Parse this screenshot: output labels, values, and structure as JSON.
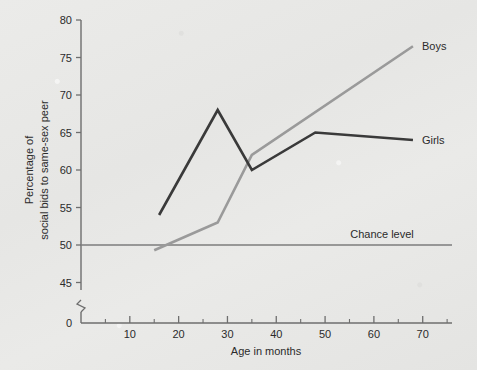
{
  "chart_data": {
    "type": "line",
    "title": "",
    "xlabel": "Age in months",
    "ylabel_line1": "Percentage of",
    "ylabel_line2": "social bids to same-sex peer",
    "xlim": [
      0,
      76
    ],
    "ylim": [
      44,
      80
    ],
    "y_axis_break": true,
    "y_zero_label": "0",
    "xticks": [
      10,
      20,
      30,
      40,
      50,
      60,
      70
    ],
    "xtick_labels": [
      "10",
      "20",
      "30",
      "40",
      "50",
      "60",
      "70"
    ],
    "xminor_ticks": [
      5,
      15,
      25,
      35,
      45,
      55,
      65,
      75
    ],
    "yticks": [
      45,
      50,
      55,
      60,
      65,
      70,
      75,
      80
    ],
    "ytick_labels": [
      "45",
      "50",
      "55",
      "60",
      "65",
      "70",
      "75",
      "80"
    ],
    "grid": false,
    "legend_position": "inline-end-of-line",
    "annotations": [
      {
        "text": "Chance level",
        "value": 50,
        "kind": "reference-line"
      }
    ],
    "series": [
      {
        "name": "Boys",
        "label": "Boys",
        "color": "#9a9a9a",
        "x": [
          15,
          28,
          35,
          68
        ],
        "y": [
          49.3,
          53.0,
          62.0,
          76.5
        ]
      },
      {
        "name": "Girls",
        "label": "Girls",
        "color": "#3a3a3a",
        "x": [
          16,
          28,
          35,
          48,
          68
        ],
        "y": [
          54.0,
          68.0,
          60.0,
          65.0,
          64.0
        ]
      }
    ]
  },
  "figure": {
    "axis_color": "#6e6e6e",
    "reference_line_color": "#7d7d7d",
    "background": "#e8e8e6"
  }
}
